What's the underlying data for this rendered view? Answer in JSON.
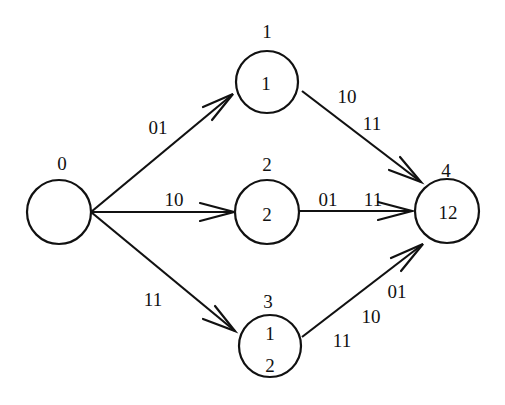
{
  "diagram": {
    "type": "directed-graph",
    "colors": {
      "stroke": "#111111",
      "background": "#ffffff"
    },
    "nodes": [
      {
        "id": "0",
        "label": "0",
        "contents": []
      },
      {
        "id": "1",
        "label": "1",
        "contents": [
          "1"
        ]
      },
      {
        "id": "2",
        "label": "2",
        "contents": [
          "2"
        ]
      },
      {
        "id": "3",
        "label": "3",
        "contents": [
          "1",
          "2"
        ]
      },
      {
        "id": "4",
        "label": "4",
        "contents": [
          "12"
        ]
      }
    ],
    "edges": [
      {
        "from": "0",
        "to": "1",
        "labels": [
          "01"
        ]
      },
      {
        "from": "0",
        "to": "2",
        "labels": [
          "10"
        ]
      },
      {
        "from": "0",
        "to": "3",
        "labels": [
          "11"
        ]
      },
      {
        "from": "1",
        "to": "4",
        "labels": [
          "10",
          "11"
        ]
      },
      {
        "from": "2",
        "to": "4",
        "labels": [
          "01",
          "11"
        ]
      },
      {
        "from": "3",
        "to": "4",
        "labels": [
          "01",
          "10",
          "11"
        ]
      }
    ]
  }
}
